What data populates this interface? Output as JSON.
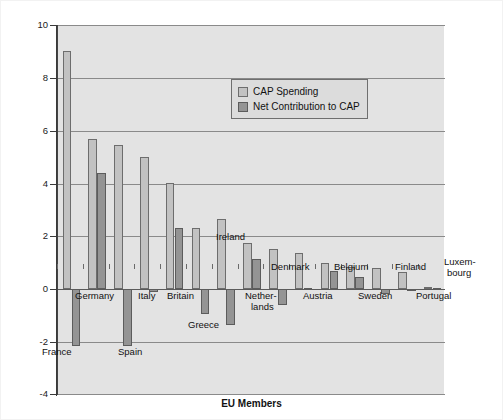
{
  "chart_data": {
    "type": "bar",
    "title": "",
    "xlabel": "EU Members",
    "ylabel": "Euros bn.",
    "ylim": [
      -4,
      10
    ],
    "yticks": [
      -4,
      -2,
      0,
      2,
      4,
      6,
      8,
      10
    ],
    "ytick_labels": [
      "-4",
      "-2",
      "0",
      "2",
      "4",
      "6",
      "8",
      "10"
    ],
    "grid": "horizontal",
    "legend_position": "upper-center-right",
    "categories": [
      "France",
      "Germany",
      "Spain",
      "Italy",
      "Britain",
      "Greece",
      "Ireland",
      "Netherlands",
      "Denmark",
      "Austria",
      "Belgium",
      "Sweden",
      "Finland",
      "Portugal",
      "Luxembourg"
    ],
    "series": [
      {
        "name": "CAP Spending",
        "color": "#c2c2c2",
        "values": [
          9.0,
          5.7,
          5.45,
          5.0,
          4.0,
          2.3,
          2.65,
          1.75,
          1.5,
          1.35,
          1.0,
          0.85,
          0.8,
          0.65,
          0.08
        ]
      },
      {
        "name": "Net Contribution to CAP",
        "color": "#949494",
        "values": [
          -2.15,
          4.4,
          -2.15,
          -0.1,
          2.3,
          -0.95,
          -1.35,
          1.15,
          -0.6,
          0.05,
          0.7,
          0.45,
          -0.2,
          -0.08,
          0.05
        ]
      }
    ]
  },
  "legend": {
    "items": [
      {
        "label": "CAP Spending"
      },
      {
        "label": "Net Contribution to CAP"
      }
    ]
  },
  "axes": {
    "y_title": "Euros bn.",
    "x_title": "EU Members"
  },
  "category_labels": [
    {
      "text": "France"
    },
    {
      "text": "Germany"
    },
    {
      "text": "Spain"
    },
    {
      "text": "Italy"
    },
    {
      "text": "Britain"
    },
    {
      "text": "Greece"
    },
    {
      "text": "Ireland"
    },
    {
      "text": "Nether-"
    },
    {
      "text": "lands"
    },
    {
      "text": "Denmark"
    },
    {
      "text": "Austria"
    },
    {
      "text": "Belgium"
    },
    {
      "text": "Sweden"
    },
    {
      "text": "Finland"
    },
    {
      "text": "Portugal"
    },
    {
      "text": "Luxem-"
    },
    {
      "text": "bourg"
    }
  ]
}
